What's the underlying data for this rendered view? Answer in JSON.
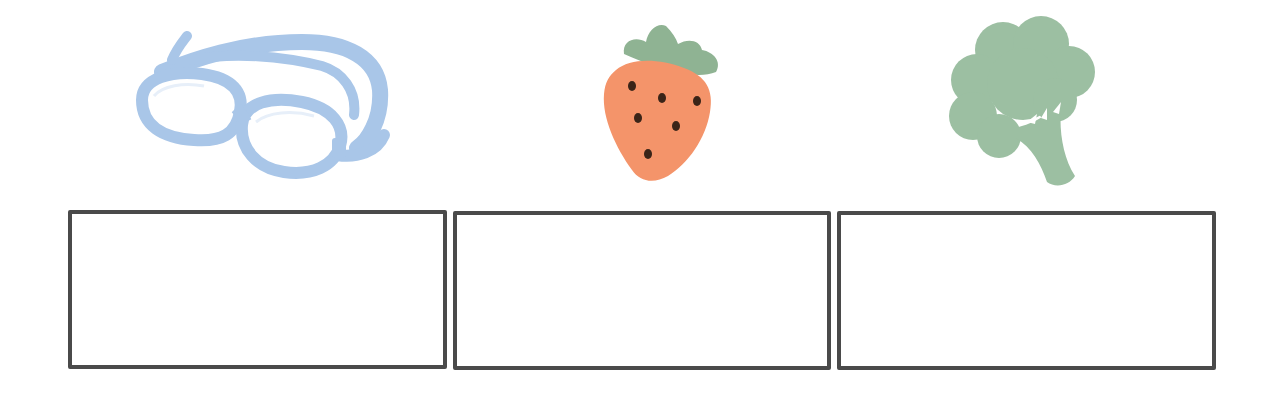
{
  "worksheet": {
    "items": [
      {
        "picture": "swimming-goggles",
        "icon": "goggles-icon",
        "color": "#a9c6e8",
        "answer": ""
      },
      {
        "picture": "strawberry",
        "icon": "strawberry-icon",
        "color": "#f4946a",
        "leaf_color": "#8fb393",
        "seed_color": "#3a2418",
        "answer": ""
      },
      {
        "picture": "broccoli",
        "icon": "broccoli-icon",
        "color": "#9cbfa2",
        "answer": ""
      }
    ],
    "box_border_color": "#4a4a4a"
  }
}
